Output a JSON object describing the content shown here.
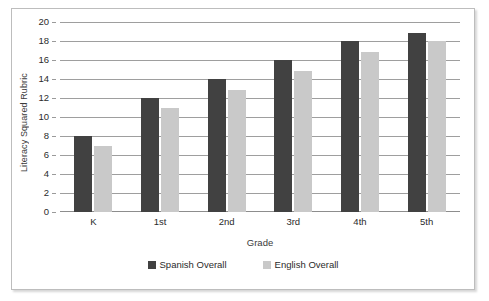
{
  "chart_data": {
    "type": "bar",
    "title": "",
    "xlabel": "Grade",
    "ylabel": "Literacy Squared Rubric",
    "categories": [
      "K",
      "1st",
      "2nd",
      "3rd",
      "4th",
      "5th"
    ],
    "series": [
      {
        "name": "Spanish Overall",
        "color": "#414141",
        "values": [
          8,
          12,
          14,
          16,
          18,
          18.8
        ]
      },
      {
        "name": "English Overall",
        "color": "#c9c9c9",
        "values": [
          7,
          11,
          12.8,
          14.8,
          16.8,
          18
        ]
      }
    ],
    "ylim": [
      0,
      20
    ],
    "ytick_step": 2,
    "yticks": [
      0,
      2,
      4,
      6,
      8,
      10,
      12,
      14,
      16,
      18,
      20
    ],
    "grid": true,
    "legend_position": "bottom"
  },
  "legend": {
    "items": [
      {
        "label": "Spanish Overall"
      },
      {
        "label": "English Overall"
      }
    ]
  },
  "colors": {
    "spanish": "#414141",
    "english": "#c9c9c9",
    "gridline": "#9e9e9e",
    "frame": "#bdbdbd",
    "text": "#2b2b2b"
  }
}
